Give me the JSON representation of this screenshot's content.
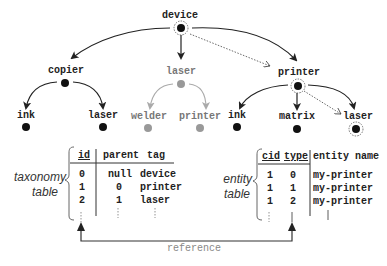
{
  "diagram": {
    "tree": {
      "nodes": [
        {
          "id": "device",
          "label": "device",
          "x": 181,
          "y": 28,
          "style": "ringed"
        },
        {
          "id": "copier",
          "label": "copier",
          "x": 65,
          "y": 83,
          "style": "black"
        },
        {
          "id": "laser_mid",
          "label": "laser",
          "x": 181,
          "y": 84,
          "style": "gray"
        },
        {
          "id": "printer",
          "label": "printer",
          "x": 298,
          "y": 86,
          "style": "ringed"
        },
        {
          "id": "ink_left",
          "label": "ink",
          "x": 26,
          "y": 127,
          "style": "black"
        },
        {
          "id": "laser_left",
          "label": "laser",
          "x": 103,
          "y": 127,
          "style": "black"
        },
        {
          "id": "welder",
          "label": "welder",
          "x": 148,
          "y": 127,
          "style": "gray"
        },
        {
          "id": "printer_mid",
          "label": "printer",
          "x": 200,
          "y": 127,
          "style": "gray"
        },
        {
          "id": "ink_right",
          "label": "ink",
          "x": 237,
          "y": 127,
          "style": "black"
        },
        {
          "id": "matrix",
          "label": "matrix",
          "x": 297,
          "y": 128,
          "style": "black"
        },
        {
          "id": "laser_right",
          "label": "laser",
          "x": 356,
          "y": 128,
          "style": "ringed"
        }
      ],
      "edges": [
        {
          "from": "device",
          "to": "copier",
          "style": "solid"
        },
        {
          "from": "device",
          "to": "laser_mid",
          "style": "solid"
        },
        {
          "from": "device",
          "to": "printer",
          "style": "solid"
        },
        {
          "from": "device",
          "to": "printer",
          "style": "dotted"
        },
        {
          "from": "copier",
          "to": "ink_left",
          "style": "solid"
        },
        {
          "from": "copier",
          "to": "laser_left",
          "style": "solid"
        },
        {
          "from": "laser_mid",
          "to": "welder",
          "style": "gray"
        },
        {
          "from": "laser_mid",
          "to": "printer_mid",
          "style": "gray"
        },
        {
          "from": "printer",
          "to": "ink_right",
          "style": "solid"
        },
        {
          "from": "printer",
          "to": "matrix",
          "style": "solid"
        },
        {
          "from": "printer",
          "to": "laser_right",
          "style": "solid"
        },
        {
          "from": "printer",
          "to": "laser_right",
          "style": "dotted"
        }
      ]
    },
    "taxonomy_table": {
      "caption_line1": "taxonomy",
      "caption_line2": "table",
      "headers": [
        "id",
        "parent",
        "tag"
      ],
      "rows": [
        [
          "0",
          "null",
          "device"
        ],
        [
          "1",
          "0",
          "printer"
        ],
        [
          "2",
          "1",
          "laser"
        ]
      ]
    },
    "entity_table": {
      "caption_line1": "entity",
      "caption_line2": "table",
      "headers": [
        "cid",
        "type",
        "entity name"
      ],
      "rows": [
        [
          "1",
          "0",
          "my-printer"
        ],
        [
          "1",
          "1",
          "my-printer"
        ],
        [
          "1",
          "2",
          "my-printer"
        ]
      ]
    },
    "reference_label": "reference",
    "colors": {
      "black": "#111111",
      "gray": "#999999",
      "line": "#333333"
    }
  }
}
